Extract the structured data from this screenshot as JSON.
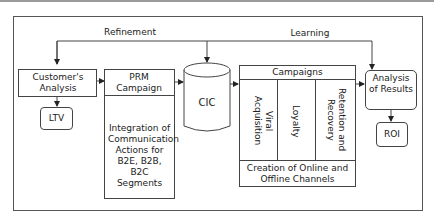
{
  "diagram": {
    "feedback_labels": {
      "refinement": "Refinement",
      "learning": "Learning"
    },
    "nodes": {
      "customers_analysis": "Customer's Analysis",
      "ltv": "LTV",
      "prm_campaign": {
        "title": "PRM Campaign",
        "body": "Integration of Communication Actions for B2E, B2B, B2C Segments"
      },
      "cic": "CIC",
      "campaigns": {
        "title": "Campaigns",
        "columns": [
          "Viral Acquisition",
          "Loyalty",
          "Retention and Recovery"
        ],
        "footer": "Creation of Online and Offline Channels"
      },
      "analysis_of_results": "Analysis of Results",
      "roi": "ROI"
    },
    "colors": {
      "line": "#444444",
      "top_rule": "#999999"
    }
  }
}
